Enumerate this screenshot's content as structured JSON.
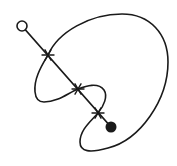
{
  "diagram": {
    "type": "knot-like curve with puncture axis",
    "width": 177,
    "height": 166,
    "stroke_color": "#1a1a1a",
    "background": "#ffffff",
    "start_point": {
      "x": 22,
      "y": 26,
      "r": 5,
      "style": "open-circle"
    },
    "end_point": {
      "x": 111,
      "y": 127,
      "r": 5.5,
      "style": "filled-circle"
    },
    "axis": {
      "from": [
        22,
        26
      ],
      "to": [
        111,
        127
      ]
    },
    "crossings": [
      {
        "x": 48,
        "y": 55,
        "marker": "star"
      },
      {
        "x": 78,
        "y": 89,
        "marker": "star"
      },
      {
        "x": 98,
        "y": 113,
        "marker": "star"
      }
    ],
    "curve_path": "M48,55 C58,32 90,14 122,14 C150,14 168,34 168,62 C168,100 140,140 108,148 C90,153 80,152 80,142 C80,130 90,122 98,113 C104,106 108,96 104,90 C98,82 86,86 78,89 C68,93 58,102 44,102 C32,102 34,84 38,74 C41,66 45,60 48,55 Z"
  }
}
